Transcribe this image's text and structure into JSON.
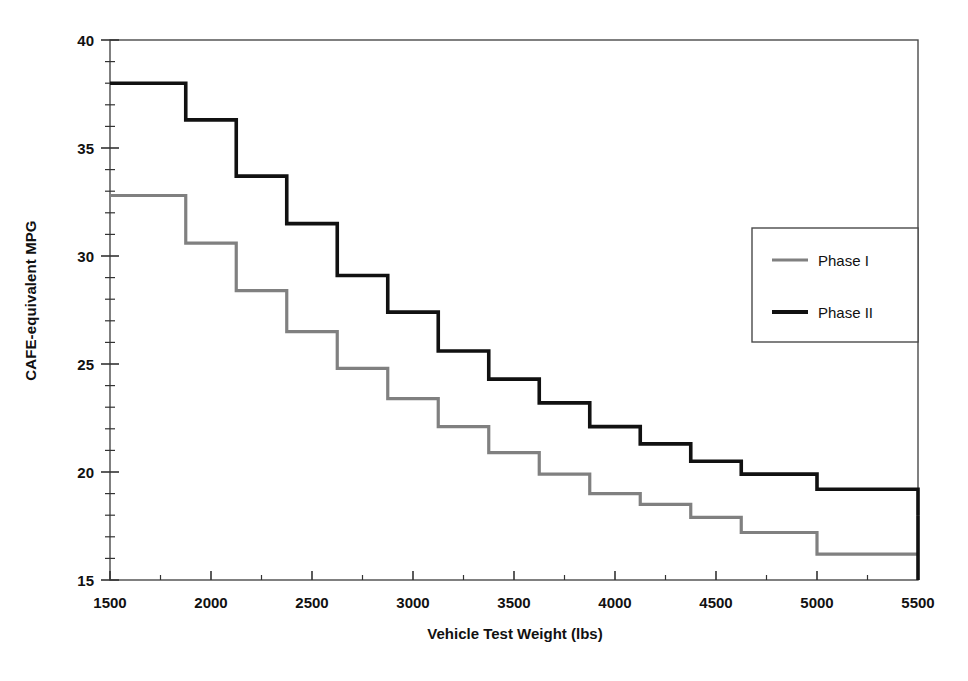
{
  "chart_data": {
    "type": "line",
    "title": "",
    "subtitle": "",
    "xlabel": "Vehicle Test Weight (lbs)",
    "ylabel": "CAFE-equivalent MPG",
    "xlim": [
      1500,
      5500
    ],
    "ylim": [
      15,
      40
    ],
    "x_major_ticks": [
      1500,
      2000,
      2500,
      3000,
      3500,
      4000,
      4500,
      5000,
      5500
    ],
    "x_minor_step": 250,
    "y_major_ticks": [
      15,
      20,
      25,
      30,
      35,
      40
    ],
    "y_minor_step": 1,
    "grid": false,
    "legend_position": "right",
    "step_style": "post",
    "x_breakpoints": [
      1500,
      1750,
      1875,
      2125,
      2375,
      2625,
      2875,
      3125,
      3375,
      3625,
      3875,
      4125,
      4375,
      4625,
      5000,
      5500
    ],
    "series": [
      {
        "name": "Phase I",
        "color": "#808080",
        "width": 3.2,
        "x": [
          1500,
          1875,
          2125,
          2375,
          2625,
          2875,
          3125,
          3375,
          3625,
          3875,
          4125,
          4375,
          4625,
          5000,
          5500
        ],
        "values": [
          32.8,
          30.6,
          28.4,
          26.5,
          24.8,
          23.4,
          22.1,
          20.9,
          19.9,
          19.0,
          18.5,
          17.9,
          17.2,
          16.2,
          16.2
        ]
      },
      {
        "name": "Phase II",
        "color": "#111111",
        "width": 3.6,
        "x": [
          1500,
          1750,
          1875,
          2125,
          2375,
          2625,
          2875,
          3125,
          3375,
          3625,
          3875,
          4125,
          4375,
          4625,
          5000,
          5500
        ],
        "values": [
          38.0,
          38.0,
          36.3,
          33.7,
          31.5,
          29.1,
          27.4,
          25.6,
          24.3,
          23.2,
          22.1,
          21.3,
          20.5,
          19.9,
          19.2,
          18.0
        ]
      }
    ],
    "x_tick_labels": [
      "1500",
      "2000",
      "2500",
      "3000",
      "3500",
      "4000",
      "4500",
      "5000",
      "5500"
    ],
    "y_tick_labels": [
      "15",
      "20",
      "25",
      "30",
      "35",
      "40"
    ],
    "legend_entries": [
      {
        "label": "Phase I",
        "color": "#808080"
      },
      {
        "label": "Phase II",
        "color": "#111111"
      }
    ]
  },
  "axes": {
    "x_title": "Vehicle Test Weight (lbs)",
    "y_title": "CAFE-equivalent MPG"
  },
  "legend": {
    "item1_label": "Phase I",
    "item2_label": "Phase II"
  }
}
